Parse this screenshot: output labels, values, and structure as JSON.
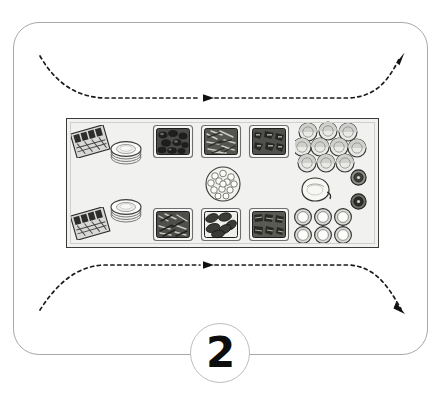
{
  "diagram": {
    "title": "Buffet service line layout",
    "step_number": "2",
    "frame_label": "setup-area-frame"
  },
  "flow": {
    "top_path_label": "guest flow path top",
    "bottom_path_label": "guest flow path bottom",
    "direction": "left to right",
    "style": "dashed",
    "arrow_color": "#1a1a1a",
    "arrowheads": [
      "top-middle",
      "top-right-exit",
      "bottom-middle",
      "bottom-right-exit"
    ]
  },
  "table": {
    "label": "buffet table",
    "surface_color": "#f1f1f0",
    "border_color": "#3a3a3a",
    "groups": [
      {
        "name": "cutlery-station",
        "items": [
          {
            "type": "cutlery-tray",
            "label": "Cutlery tray (upper)",
            "count": 1
          },
          {
            "type": "cutlery-tray",
            "label": "Cutlery tray (lower)",
            "count": 1
          }
        ]
      },
      {
        "name": "plate-station",
        "items": [
          {
            "type": "plate-stack",
            "label": "Plate stack (upper)",
            "count": 1
          },
          {
            "type": "plate-stack",
            "label": "Plate stack (lower)",
            "count": 1
          }
        ]
      },
      {
        "name": "food-station-top-row",
        "items": [
          {
            "type": "food-tray",
            "label": "Food tray 1",
            "count": 1
          },
          {
            "type": "food-tray",
            "label": "Food tray 2",
            "count": 1
          },
          {
            "type": "food-tray",
            "label": "Food tray 3",
            "count": 1
          }
        ]
      },
      {
        "name": "food-station-bottom-row",
        "items": [
          {
            "type": "food-tray",
            "label": "Food tray 4",
            "count": 1
          },
          {
            "type": "food-tray",
            "label": "Food tray 5",
            "count": 1
          },
          {
            "type": "food-tray",
            "label": "Food tray 6",
            "count": 1
          }
        ]
      },
      {
        "name": "centre-station",
        "items": [
          {
            "type": "salad-bowl",
            "label": "Salad bowl",
            "count": 1
          }
        ]
      },
      {
        "name": "beverage-station",
        "items": [
          {
            "type": "glass",
            "label": "Glasses",
            "count": 10,
            "rows": [
              3,
              4,
              3
            ]
          },
          {
            "type": "pitcher",
            "label": "Pitcher",
            "count": 1
          },
          {
            "type": "urn-lid",
            "label": "Urn lids",
            "count": 2
          },
          {
            "type": "cup",
            "label": "Cups",
            "count": 6,
            "rows": [
              3,
              3
            ]
          }
        ]
      }
    ]
  }
}
